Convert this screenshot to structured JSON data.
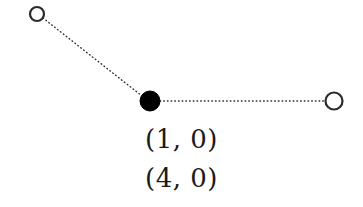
{
  "figure": {
    "type": "graph-diagram",
    "background_color": "#ffffff",
    "stroke_color": "#1a1a1a",
    "node_fill_open": "#ffffff",
    "node_fill_filled": "#000000",
    "edge_style": "dotted"
  },
  "nodes": [
    {
      "id": "node-left",
      "name": "open-node-left",
      "cx": 37,
      "cy": 14,
      "r": 7,
      "fill": "#ffffff",
      "stroke": "#2b2b2b",
      "stroke_width": 2.2,
      "state": "open"
    },
    {
      "id": "node-center",
      "name": "filled-node-center",
      "cx": 150,
      "cy": 101,
      "r": 10,
      "fill": "#000000",
      "stroke": "#000000",
      "stroke_width": 1,
      "state": "filled"
    },
    {
      "id": "node-right",
      "name": "open-node-right",
      "cx": 334,
      "cy": 101,
      "r": 8.5,
      "fill": "#ffffff",
      "stroke": "#2b2b2b",
      "stroke_width": 2.2,
      "state": "open"
    }
  ],
  "edges": [
    {
      "id": "edge-left-center",
      "name": "dotted-edge-left-center",
      "x1": 43,
      "y1": 18,
      "x2": 142,
      "y2": 96,
      "stroke": "#2b2b2b",
      "stroke_width": 1.4,
      "dash": "0.6 3.1"
    },
    {
      "id": "edge-center-right",
      "name": "dotted-edge-center-right",
      "x1": 160,
      "y1": 101,
      "x2": 325,
      "y2": 101,
      "stroke": "#2b2b2b",
      "stroke_width": 1.4,
      "dash": "0.6 3.1"
    }
  ],
  "labels": {
    "line1": "(1, 0)",
    "line2": "(4, 0)"
  }
}
